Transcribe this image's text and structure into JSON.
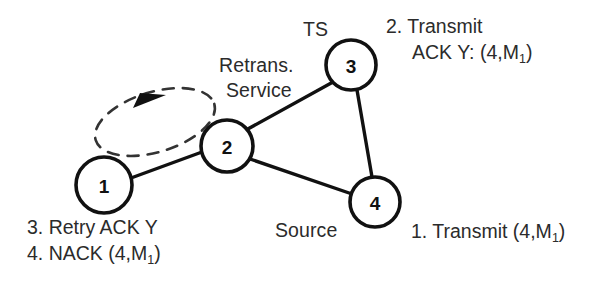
{
  "diagram": {
    "colors": {
      "stroke": "#111111",
      "text": "#2b2b2b",
      "background": "#ffffff",
      "dashed_loop": "#333333"
    },
    "nodes": [
      {
        "id": "1",
        "label": "1",
        "cx": 104,
        "cy": 185,
        "r": 28
      },
      {
        "id": "2",
        "label": "2",
        "cx": 227,
        "cy": 146,
        "r": 26
      },
      {
        "id": "3",
        "label": "3",
        "cx": 351,
        "cy": 65,
        "r": 25
      },
      {
        "id": "4",
        "label": "4",
        "cx": 375,
        "cy": 202,
        "r": 25
      }
    ],
    "edges": [
      {
        "from": "1",
        "to": "2",
        "style": "solid"
      },
      {
        "from": "2",
        "to": "3",
        "style": "solid"
      },
      {
        "from": "2",
        "to": "4",
        "style": "solid"
      },
      {
        "from": "3",
        "to": "4",
        "style": "solid"
      }
    ],
    "loop": {
      "style": "dashed",
      "direction": "clockwise",
      "between": [
        "1",
        "2"
      ],
      "arrowhead": "filled-triangle"
    },
    "node_labels": {
      "ts": "TS",
      "retrans": "Retrans.",
      "service": "Service",
      "source": "Source"
    },
    "annotations": {
      "transmit_ack": {
        "line1": "2. Transmit",
        "line2_prefix": "ACK Y: (4,M",
        "line2_sub": "1",
        "line2_suffix": ")"
      },
      "retry_nack": {
        "line1": "3. Retry ACK Y",
        "line2_prefix": "4. NACK (4,M",
        "line2_sub": "1",
        "line2_suffix": ")"
      },
      "transmit": {
        "prefix": "1. Transmit (4,M",
        "sub": "1",
        "suffix": ")"
      }
    }
  }
}
